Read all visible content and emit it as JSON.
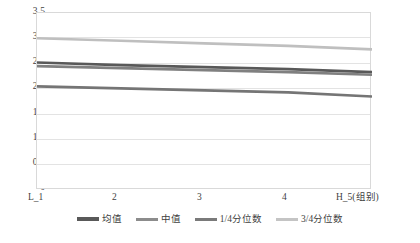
{
  "chart_data": {
    "type": "line",
    "title": "",
    "xlabel": "",
    "ylabel": "",
    "x": [
      1,
      2,
      3,
      4,
      5
    ],
    "categories": [
      "L_1",
      "2",
      "3",
      "4",
      "H_5(组别)"
    ],
    "ylim": [
      0,
      3.5
    ],
    "yticks": [
      "3.5",
      "3.0",
      "2.5",
      "2.0",
      "1.5",
      "1.0",
      "0.5",
      "0"
    ],
    "ytick_values": [
      3.5,
      3.0,
      2.5,
      2.0,
      1.5,
      1.0,
      0.5,
      0
    ],
    "grid": true,
    "legend_position": "bottom",
    "series": [
      {
        "name": "均值",
        "color": "#595959",
        "width": 2.6,
        "values": [
          2.52,
          2.47,
          2.43,
          2.39,
          2.33
        ]
      },
      {
        "name": "中值",
        "color": "#808080",
        "width": 2.6,
        "values": [
          2.45,
          2.41,
          2.37,
          2.33,
          2.28
        ]
      },
      {
        "name": "1/4分位数",
        "color": "#757575",
        "width": 2.6,
        "values": [
          2.05,
          2.01,
          1.97,
          1.93,
          1.85
        ]
      },
      {
        "name": "3/4分位数",
        "color": "#bfbfbf",
        "width": 2.6,
        "values": [
          3.0,
          2.95,
          2.9,
          2.85,
          2.78
        ]
      }
    ]
  },
  "axis": {
    "y_labels": [
      "3.5",
      "3.0",
      "2.5",
      "2.0",
      "1.5",
      "1.0",
      "0.5",
      "0"
    ],
    "x_labels": [
      "L_1",
      "2",
      "3",
      "4",
      "H_5(组别)"
    ]
  },
  "legend": {
    "items": [
      {
        "label": "均值",
        "color": "#595959"
      },
      {
        "label": "中值",
        "color": "#808080"
      },
      {
        "label": "1/4分位数",
        "color": "#757575"
      },
      {
        "label": "3/4分位数",
        "color": "#bfbfbf"
      }
    ]
  }
}
